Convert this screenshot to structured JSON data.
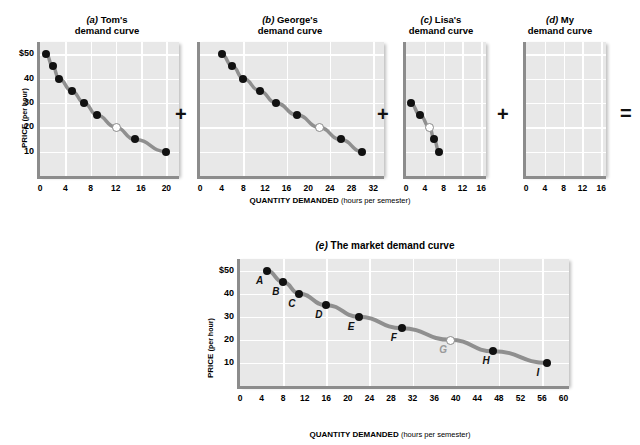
{
  "figure": {
    "operators": [
      "+",
      "+",
      "+",
      "="
    ],
    "axis_titles": {
      "price": "PRICE",
      "price_unit": "(per hour)",
      "quantity": "QUANTITY DEMANDED",
      "quantity_unit": "(hours per semester)"
    }
  },
  "panels": [
    {
      "id": "a",
      "letter": "(a)",
      "title_line1": "Tom's",
      "title_line2": "demand curve",
      "title": "(a) Tom's demand curve",
      "xticks": [
        "0",
        "4",
        "8",
        "12",
        "16",
        "20"
      ],
      "xvalues": [
        0,
        4,
        8,
        12,
        16,
        20
      ],
      "yticks": [
        "$50",
        "40",
        "30",
        "20",
        "10"
      ],
      "yvalues": [
        50,
        40,
        30,
        20,
        10
      ],
      "xmax": 22,
      "ymax": 55,
      "points": [
        {
          "q": 1,
          "p": 50,
          "open": false
        },
        {
          "q": 2,
          "p": 45,
          "open": false
        },
        {
          "q": 3,
          "p": 40,
          "open": false
        },
        {
          "q": 5,
          "p": 35,
          "open": false
        },
        {
          "q": 7,
          "p": 30,
          "open": false
        },
        {
          "q": 9,
          "p": 25,
          "open": false
        },
        {
          "q": 12,
          "p": 20,
          "open": true
        },
        {
          "q": 15,
          "p": 15,
          "open": false
        },
        {
          "q": 20,
          "p": 10,
          "open": false
        }
      ]
    },
    {
      "id": "b",
      "letter": "(b)",
      "title_line1": "George's",
      "title_line2": "demand curve",
      "title": "(b) George's demand curve",
      "xticks": [
        "0",
        "4",
        "8",
        "12",
        "16",
        "20",
        "24",
        "28",
        "32"
      ],
      "xvalues": [
        0,
        4,
        8,
        12,
        16,
        20,
        24,
        28,
        32
      ],
      "yticks": [],
      "yvalues": [
        50,
        40,
        30,
        20,
        10
      ],
      "xmax": 34,
      "ymax": 55,
      "points": [
        {
          "q": 4,
          "p": 50,
          "open": false
        },
        {
          "q": 6,
          "p": 45,
          "open": false
        },
        {
          "q": 8,
          "p": 40,
          "open": false
        },
        {
          "q": 11,
          "p": 35,
          "open": false
        },
        {
          "q": 14,
          "p": 30,
          "open": false
        },
        {
          "q": 18,
          "p": 25,
          "open": false
        },
        {
          "q": 22,
          "p": 20,
          "open": true
        },
        {
          "q": 26,
          "p": 15,
          "open": false
        },
        {
          "q": 30,
          "p": 10,
          "open": false
        }
      ]
    },
    {
      "id": "c",
      "letter": "(c)",
      "title_line1": "Lisa's",
      "title_line2": "demand curve",
      "title": "(c) Lisa's demand curve",
      "xticks": [
        "0",
        "4",
        "8",
        "12",
        "16"
      ],
      "xvalues": [
        0,
        4,
        8,
        12,
        16
      ],
      "yticks": [],
      "yvalues": [
        50,
        40,
        30,
        20,
        10
      ],
      "xmax": 17,
      "ymax": 55,
      "points": [
        {
          "q": 1,
          "p": 30,
          "open": false
        },
        {
          "q": 3,
          "p": 25,
          "open": false
        },
        {
          "q": 5,
          "p": 20,
          "open": true
        },
        {
          "q": 6,
          "p": 15,
          "open": false
        },
        {
          "q": 7,
          "p": 10,
          "open": false
        }
      ]
    },
    {
      "id": "d",
      "letter": "(d)",
      "title_line1": "My",
      "title_line2": "demand curve",
      "title": "(d) My demand curve",
      "xticks": [
        "0",
        "4",
        "8",
        "12",
        "16"
      ],
      "xvalues": [
        0,
        4,
        8,
        12,
        16
      ],
      "yticks": [],
      "yvalues": [
        50,
        40,
        30,
        20,
        10
      ],
      "xmax": 17,
      "ymax": 55,
      "points": []
    }
  ],
  "market": {
    "id": "e",
    "letter": "(e)",
    "title_rest": " The market demand curve",
    "title": "(e) The market demand curve",
    "xticks": [
      "0",
      "4",
      "8",
      "12",
      "16",
      "20",
      "24",
      "28",
      "32",
      "36",
      "40",
      "44",
      "48",
      "52",
      "56",
      "60"
    ],
    "xvalues": [
      0,
      4,
      8,
      12,
      16,
      20,
      24,
      28,
      32,
      36,
      40,
      44,
      48,
      52,
      56,
      60
    ],
    "yticks": [
      "$50",
      "40",
      "30",
      "20",
      "10"
    ],
    "yvalues": [
      50,
      40,
      30,
      20,
      10
    ],
    "xmax": 61,
    "ymax": 55,
    "points": [
      {
        "label": "A",
        "q": 5,
        "p": 50,
        "open": false
      },
      {
        "label": "B",
        "q": 8,
        "p": 45,
        "open": false
      },
      {
        "label": "C",
        "q": 11,
        "p": 40,
        "open": false
      },
      {
        "label": "D",
        "q": 16,
        "p": 35,
        "open": false
      },
      {
        "label": "E",
        "q": 22,
        "p": 30,
        "open": false
      },
      {
        "label": "F",
        "q": 30,
        "p": 25,
        "open": false
      },
      {
        "label": "G",
        "q": 39,
        "p": 20,
        "open": true
      },
      {
        "label": "H",
        "q": 47,
        "p": 15,
        "open": false
      },
      {
        "label": "I",
        "q": 57,
        "p": 10,
        "open": false
      }
    ]
  },
  "chart_data": {
    "type": "line",
    "xlabel": "QUANTITY DEMANDED (hours per semester)",
    "ylabel": "PRICE (per hour)",
    "ylim": [
      0,
      50
    ],
    "grid": true,
    "legend": "none",
    "series": [
      {
        "name": "(a) Tom's demand curve",
        "xlim": [
          0,
          20
        ],
        "x": [
          1,
          2,
          3,
          5,
          7,
          9,
          12,
          15,
          20
        ],
        "y": [
          50,
          45,
          40,
          35,
          30,
          25,
          20,
          15,
          10
        ]
      },
      {
        "name": "(b) George's demand curve",
        "xlim": [
          0,
          32
        ],
        "x": [
          4,
          6,
          8,
          11,
          14,
          18,
          22,
          26,
          30
        ],
        "y": [
          50,
          45,
          40,
          35,
          30,
          25,
          20,
          15,
          10
        ]
      },
      {
        "name": "(c) Lisa's demand curve",
        "xlim": [
          0,
          16
        ],
        "x": [
          1,
          3,
          5,
          6,
          7
        ],
        "y": [
          30,
          25,
          20,
          15,
          10
        ]
      },
      {
        "name": "(d) My demand curve",
        "xlim": [
          0,
          16
        ],
        "x": [],
        "y": []
      },
      {
        "name": "(e) The market demand curve",
        "xlim": [
          0,
          60
        ],
        "x": [
          5,
          8,
          11,
          16,
          22,
          30,
          39,
          47,
          57
        ],
        "y": [
          50,
          45,
          40,
          35,
          30,
          25,
          20,
          15,
          10
        ],
        "point_labels": [
          "A",
          "B",
          "C",
          "D",
          "E",
          "F",
          "G",
          "H",
          "I"
        ]
      }
    ]
  }
}
